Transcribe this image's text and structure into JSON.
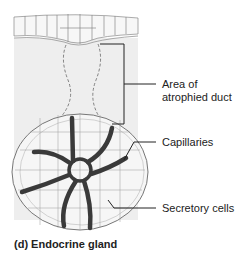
{
  "figure": {
    "caption": "(d)  Endocrine gland",
    "labels": {
      "duct_line1": "Area of",
      "duct_line2": "atrophied duct",
      "capillaries": "Capillaries",
      "secretory": "Secretory cells"
    },
    "colors": {
      "connective_tissue": "#eeeeee",
      "cell_fill": "#f6f6f6",
      "outline": "#888888",
      "capillary": "#3a3a3a",
      "leader": "#222222"
    }
  }
}
